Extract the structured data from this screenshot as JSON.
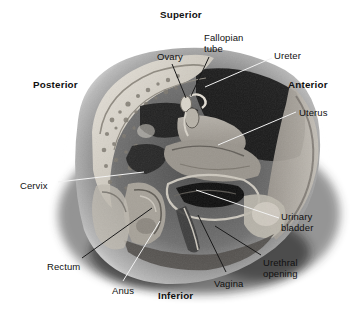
{
  "figure": {
    "background_color": "#ffffff",
    "ink_color": "#111111",
    "leader_light_color": "#f2f2f2",
    "leader_dark_color": "#1a1a1a",
    "orientation_labels": [
      {
        "name": "superior",
        "text": "Superior",
        "x": 160,
        "y": 10,
        "bold": true
      },
      {
        "name": "inferior",
        "text": "Inferior",
        "x": 158,
        "y": 291,
        "bold": true
      },
      {
        "name": "posterior",
        "text": "Posterior",
        "x": 33,
        "y": 80,
        "bold": true
      },
      {
        "name": "anterior",
        "text": "Anterior",
        "x": 288,
        "y": 80,
        "bold": true
      }
    ],
    "structure_labels": [
      {
        "name": "ovary",
        "text": "Ovary",
        "x": 157,
        "y": 52,
        "align": "left"
      },
      {
        "name": "fallopian-tube",
        "text": "Fallopian\ntube",
        "x": 204,
        "y": 33,
        "align": "left"
      },
      {
        "name": "ureter",
        "text": "Ureter",
        "x": 274,
        "y": 51,
        "align": "left"
      },
      {
        "name": "uterus",
        "text": "Uterus",
        "x": 299,
        "y": 108,
        "align": "left"
      },
      {
        "name": "cervix",
        "text": "Cervix",
        "x": 20,
        "y": 181,
        "align": "left"
      },
      {
        "name": "rectum",
        "text": "Rectum",
        "x": 47,
        "y": 262,
        "align": "left"
      },
      {
        "name": "anus",
        "text": "Anus",
        "x": 112,
        "y": 286,
        "align": "left"
      },
      {
        "name": "vagina",
        "text": "Vagina",
        "x": 214,
        "y": 279,
        "align": "left"
      },
      {
        "name": "urethral-opening",
        "text": "Urethral\nopening",
        "x": 263,
        "y": 258,
        "align": "left"
      },
      {
        "name": "urinary-bladder",
        "text": "Urinary\nbladder",
        "x": 281,
        "y": 212,
        "align": "left"
      }
    ],
    "leader_lines": [
      {
        "name": "leader-ovary",
        "from": [
          172,
          64
        ],
        "to": [
          186,
          98
        ],
        "color": "dark"
      },
      {
        "name": "leader-fallopian-tube",
        "from": [
          209,
          57
        ],
        "to": [
          191,
          96
        ],
        "color": "dark"
      },
      {
        "name": "leader-ureter",
        "from": [
          272,
          58
        ],
        "to": [
          205,
          87
        ],
        "color": "light"
      },
      {
        "name": "leader-uterus",
        "from": [
          296,
          112
        ],
        "to": [
          218,
          145
        ],
        "color": "light"
      },
      {
        "name": "leader-cervix",
        "from": [
          58,
          182
        ],
        "to": [
          144,
          172
        ],
        "color": "light"
      },
      {
        "name": "leader-rectum",
        "from": [
          82,
          258
        ],
        "to": [
          152,
          208
        ],
        "color": "dark"
      },
      {
        "name": "leader-anus",
        "from": [
          123,
          281
        ],
        "to": [
          160,
          221
        ],
        "color": "light"
      },
      {
        "name": "leader-vagina",
        "from": [
          226,
          272
        ],
        "to": [
          198,
          215
        ],
        "color": "dark"
      },
      {
        "name": "leader-urethral-opening",
        "from": [
          261,
          255
        ],
        "to": [
          215,
          226
        ],
        "color": "dark"
      },
      {
        "name": "leader-urinary-bladder",
        "from": [
          279,
          218
        ],
        "to": [
          196,
          190
        ],
        "color": "light"
      }
    ]
  }
}
